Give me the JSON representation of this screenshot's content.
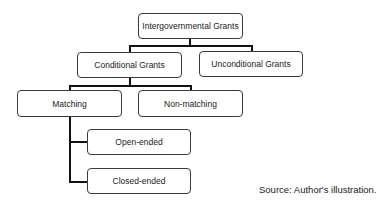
{
  "diagram": {
    "type": "tree",
    "nodes": {
      "root": {
        "label": "Intergovernmental Grants"
      },
      "conditional": {
        "label": "Conditional Grants"
      },
      "unconditional": {
        "label": "Unconditional Grants"
      },
      "matching": {
        "label": "Matching"
      },
      "non_matching": {
        "label": "Non-matching"
      },
      "open_ended": {
        "label": "Open-ended"
      },
      "closed_ended": {
        "label": "Closed-ended"
      }
    },
    "edges": [
      {
        "from": "Intergovernmental Grants",
        "to": "Conditional Grants"
      },
      {
        "from": "Intergovernmental Grants",
        "to": "Unconditional Grants"
      },
      {
        "from": "Conditional Grants",
        "to": "Matching"
      },
      {
        "from": "Conditional Grants",
        "to": "Non-matching"
      },
      {
        "from": "Matching",
        "to": "Open-ended"
      },
      {
        "from": "Matching",
        "to": "Closed-ended"
      }
    ]
  },
  "source": "Source: Author's illustration."
}
